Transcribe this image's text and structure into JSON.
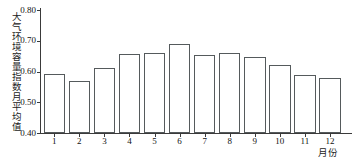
{
  "chart_data": {
    "type": "bar",
    "title": "",
    "xlabel": "月份",
    "ylabel": "大气环境容量指数月平均值",
    "categories": [
      "1",
      "2",
      "3",
      "4",
      "5",
      "6",
      "7",
      "8",
      "9",
      "10",
      "11",
      "12"
    ],
    "values": [
      0.593,
      0.57,
      0.612,
      0.657,
      0.66,
      0.691,
      0.655,
      0.66,
      0.648,
      0.622,
      0.59,
      0.58
    ],
    "ylim": [
      0.4,
      0.8
    ],
    "yticks": [
      "0.40",
      "0.50",
      "0.60",
      "0.70",
      "0.80"
    ],
    "ytick_values": [
      0.4,
      0.5,
      0.6,
      0.7,
      0.8
    ],
    "grid": false,
    "legend": false,
    "bar_fill_color": "#ffffff",
    "bar_edge_color": "#555a5c",
    "axis_color": "#3a3a3a"
  }
}
